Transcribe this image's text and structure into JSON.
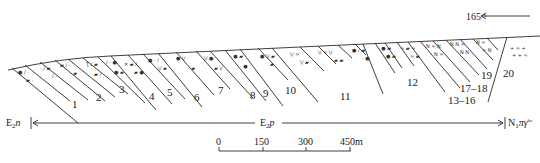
{
  "diagram": {
    "type": "geological-cross-section",
    "strike_label": "165",
    "formations": {
      "left": "E₂n",
      "middle": "E₂p",
      "right": "N₁πγᵇˢ"
    },
    "formation_parts": {
      "left": {
        "main": "E",
        "sub": "2",
        "tail": "n"
      },
      "middle": {
        "main": "E",
        "sub": "2",
        "tail": "p"
      },
      "right": {
        "main": "N",
        "sub": "1",
        "tail": "πγ",
        "sup": "bs"
      }
    },
    "beds": [
      "1",
      "2",
      "3",
      "4",
      "5",
      "6",
      "7",
      "8",
      "9",
      "10",
      "11",
      "12",
      "13–16",
      "17–18",
      "19",
      "20"
    ],
    "scale_bar": {
      "ticks": [
        "0",
        "150",
        "300",
        "450m"
      ]
    }
  }
}
